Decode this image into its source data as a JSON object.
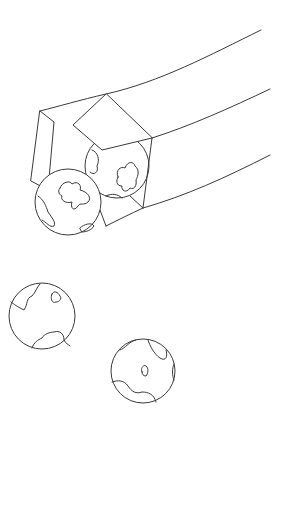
{
  "scene": {
    "description": "Line drawing of a square cannon barrel with four spotted balls",
    "stroke_color": "#3a3a3a",
    "background_color": "#ffffff",
    "cannon": {
      "label": "cannon-barrel"
    },
    "balls": [
      {
        "name": "ball-front",
        "cx": 68,
        "cy": 202,
        "r": 33
      },
      {
        "name": "ball-back",
        "cx": 117,
        "cy": 166,
        "r": 32
      },
      {
        "name": "ball-lower-left",
        "cx": 42,
        "cy": 316,
        "r": 33
      },
      {
        "name": "ball-lower-right",
        "cx": 143,
        "cy": 371,
        "r": 32
      }
    ]
  }
}
